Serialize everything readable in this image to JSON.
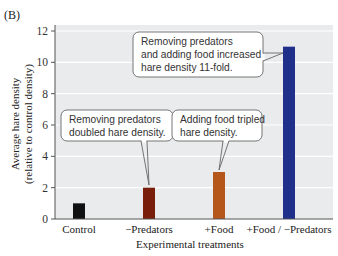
{
  "panel_label": "(B)",
  "chart_data": {
    "type": "bar",
    "title": "",
    "categories": [
      "Control",
      "−Predators",
      "+Food",
      "+Food / −Predators"
    ],
    "values": [
      1,
      2,
      3,
      11
    ],
    "colors": [
      "#111111",
      "#7a1e0c",
      "#b5561a",
      "#1f2f8a"
    ],
    "xlabel": "Experimental treatments",
    "ylabel_line1": "Average hare density",
    "ylabel_line2": "(relative to control density)",
    "ylim": [
      0,
      12
    ],
    "yticks": [
      0,
      2,
      4,
      6,
      8,
      10,
      12
    ],
    "grid": true,
    "plot_background": "#e9ebec",
    "annotations": [
      {
        "target": "−Predators",
        "lines": [
          "Removing predators",
          "doubled hare density."
        ]
      },
      {
        "target": "+Food",
        "lines": [
          "Adding food tripled",
          "hare density."
        ]
      },
      {
        "target": "+Food / −Predators",
        "lines": [
          "Removing predators",
          "and adding food increased",
          "hare density 11-fold."
        ]
      }
    ]
  }
}
